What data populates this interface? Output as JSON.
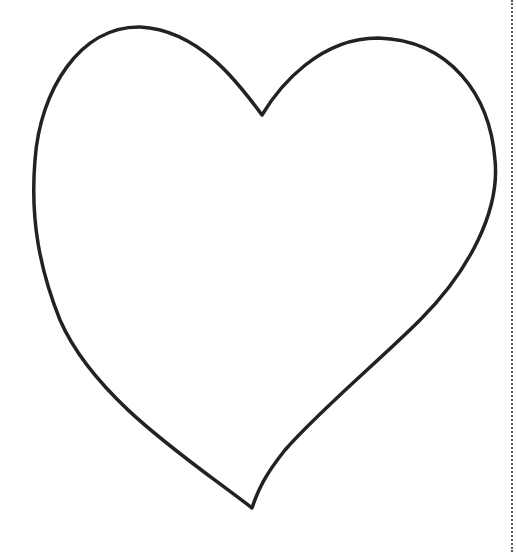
{
  "drawing": {
    "subject": "heart outline",
    "stroke_color": "#222222",
    "background": "#ffffff",
    "cut_line_color": "#555555"
  }
}
